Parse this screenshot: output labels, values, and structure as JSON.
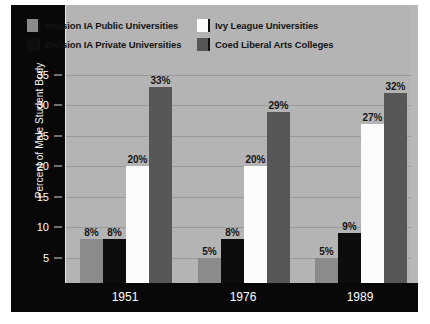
{
  "chart_data": {
    "type": "bar",
    "title": "",
    "subtitle": "",
    "xlabel": "",
    "ylabel": "Percent of Male Student Body",
    "categories": [
      "1951",
      "1976",
      "1989"
    ],
    "ylim": [
      0,
      35
    ],
    "yticks": [
      0,
      5,
      10,
      15,
      20,
      25,
      30,
      35
    ],
    "ytick_labels": [
      "0",
      "5",
      "10",
      "15",
      "20",
      "25",
      "30",
      "35"
    ],
    "value_suffix": "%",
    "grid": true,
    "legend_position": "top",
    "series": [
      {
        "name": "Division IA Public Universities",
        "color": "#8b8b8b",
        "values": [
          8,
          5,
          5
        ],
        "labels": [
          "8%",
          "5%",
          "5%"
        ]
      },
      {
        "name": "Division IA Private Universities",
        "color": "#0d0d0d",
        "values": [
          8,
          8,
          9
        ],
        "labels": [
          "8%",
          "8%",
          "9%"
        ]
      },
      {
        "name": "Ivy League Universities",
        "color": "#fcfcfc",
        "values": [
          20,
          20,
          27
        ],
        "labels": [
          "20%",
          "20%",
          "27%"
        ]
      },
      {
        "name": "Coed Liberal Arts Colleges",
        "color": "#575757",
        "values": [
          33,
          29,
          32
        ],
        "labels": [
          "33%",
          "29%",
          "32%"
        ]
      }
    ]
  },
  "legend": {
    "entries": [
      {
        "label": "Division IA Public Universities",
        "color": "#8b8b8b"
      },
      {
        "label": "Ivy League Universities",
        "color": "#fcfcfc"
      },
      {
        "label": "Division IA Private Universities",
        "color": "#0d0d0d"
      },
      {
        "label": "Coed Liberal Arts Colleges",
        "color": "#575757"
      }
    ]
  },
  "colors": {
    "plot_background": "#b4b4b4",
    "figure_background": "#b8b8b8",
    "axis_band": "#080808",
    "gridline": "#9a9a9a",
    "axis_text": "#ffffff",
    "value_text": "#151515"
  }
}
